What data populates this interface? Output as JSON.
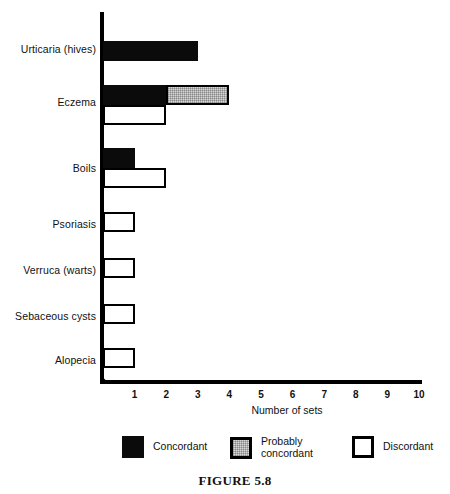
{
  "caption": "FIGURE 5.8",
  "chart_data": {
    "type": "bar",
    "orientation": "horizontal",
    "title": "",
    "xlabel": "Number of sets",
    "ylabel": "",
    "xlim": [
      0,
      10
    ],
    "xticks": [
      "1",
      "2",
      "3",
      "4",
      "5",
      "6",
      "7",
      "8",
      "9",
      "10"
    ],
    "grid": false,
    "legend_position": "bottom",
    "categories": [
      "Urticaria (hives)",
      "Eczema",
      "Boils",
      "Psoriasis",
      "Verruca (warts)",
      "Sebaceous cysts",
      "Alopecia"
    ],
    "series": [
      {
        "name": "Concordant",
        "color": "#0b0b0b",
        "values": [
          3,
          2,
          1,
          0,
          0,
          0,
          0
        ]
      },
      {
        "name": "Probably concordant",
        "color": "#d8d8d8",
        "values": [
          0,
          2,
          0,
          0,
          0,
          0,
          0
        ]
      },
      {
        "name": "Discordant",
        "color": "#ffffff",
        "values": [
          0,
          2,
          2,
          1,
          1,
          1,
          1
        ]
      }
    ],
    "bars": [
      {
        "category": "Urticaria (hives)",
        "row": 0,
        "series": "Concordant",
        "start": 0,
        "value": 3,
        "top": 41
      },
      {
        "category": "Eczema",
        "row": 1,
        "series": "Concordant",
        "start": 0,
        "value": 2,
        "top": 85
      },
      {
        "category": "Eczema",
        "row": 1,
        "series": "Probably concordant",
        "start": 2,
        "value": 2,
        "top": 85
      },
      {
        "category": "Eczema",
        "row": 1,
        "series": "Discordant",
        "start": 0,
        "value": 2,
        "top": 105
      },
      {
        "category": "Boils",
        "row": 2,
        "series": "Concordant",
        "start": 0,
        "value": 1,
        "top": 148
      },
      {
        "category": "Boils",
        "row": 2,
        "series": "Discordant",
        "start": 0,
        "value": 2,
        "top": 168
      },
      {
        "category": "Psoriasis",
        "row": 3,
        "series": "Discordant",
        "start": 0,
        "value": 1,
        "top": 212
      },
      {
        "category": "Verruca (warts)",
        "row": 4,
        "series": "Discordant",
        "start": 0,
        "value": 1,
        "top": 258
      },
      {
        "category": "Sebaceous cysts",
        "row": 5,
        "series": "Discordant",
        "start": 0,
        "value": 1,
        "top": 304
      },
      {
        "category": "Alopecia",
        "row": 6,
        "series": "Discordant",
        "start": 0,
        "value": 1,
        "top": 348
      }
    ],
    "category_label_y": [
      50,
      103,
      169,
      225,
      271,
      317,
      361
    ]
  },
  "legend": {
    "items": [
      {
        "label": "Concordant",
        "swatch": "concordant",
        "left": 122
      },
      {
        "label": "Probably\nconcordant",
        "swatch": "probable",
        "left": 230
      },
      {
        "label": "Discordant",
        "swatch": "discordant",
        "left": 352
      }
    ]
  }
}
